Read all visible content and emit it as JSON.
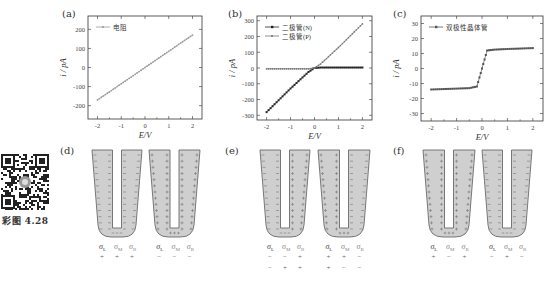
{
  "figure_caption": "彩图 4.28",
  "panels": {
    "a": {
      "label": "(a)"
    },
    "b": {
      "label": "(b)"
    },
    "c": {
      "label": "(c)"
    },
    "d": {
      "label": "(d)"
    },
    "e": {
      "label": "(e)"
    },
    "f": {
      "label": "(f)"
    }
  },
  "chart_data": [
    {
      "panel": "(a)",
      "type": "scatter",
      "xlabel": "E/V",
      "ylabel": "i / pA",
      "xlim": [
        -2.4,
        2.4
      ],
      "ylim": [
        -270,
        270
      ],
      "xticks": [
        -2,
        -1,
        0,
        1,
        2
      ],
      "yticks": [
        -200,
        -100,
        0,
        100,
        200
      ],
      "grid": false,
      "legend_position": "upper-left",
      "series": [
        {
          "name": "电阻",
          "color": "#9a9a9a",
          "marker": "dot",
          "x": [
            -2,
            -1.5,
            -1,
            -0.5,
            0,
            0.5,
            1,
            1.5,
            2
          ],
          "y": [
            -170,
            -128,
            -85,
            -43,
            0,
            43,
            85,
            128,
            170
          ]
        }
      ]
    },
    {
      "panel": "(b)",
      "type": "scatter",
      "xlabel": "E/V",
      "ylabel": "i / pA",
      "xlim": [
        -2.4,
        2.4
      ],
      "ylim": [
        -330,
        330
      ],
      "xticks": [
        -2,
        -1,
        0,
        1,
        2
      ],
      "yticks": [
        -300,
        -200,
        -100,
        0,
        100,
        200,
        300
      ],
      "grid": false,
      "legend_position": "upper-left",
      "series": [
        {
          "name": "二极管(N)",
          "color": "#222222",
          "marker": "square",
          "x": [
            -2,
            -1.5,
            -1,
            -0.5,
            -0.25,
            0,
            0.25,
            0.5,
            1,
            1.5,
            2
          ],
          "y": [
            -280,
            -205,
            -130,
            -60,
            -25,
            0,
            3,
            3,
            3,
            3,
            3
          ]
        },
        {
          "name": "二极管(P)",
          "color": "#777777",
          "marker": "dot",
          "x": [
            -2,
            -1.5,
            -1,
            -0.5,
            -0.25,
            0,
            0.25,
            0.5,
            1,
            1.5,
            2
          ],
          "y": [
            -5,
            -5,
            -5,
            -5,
            -5,
            0,
            25,
            60,
            130,
            205,
            280
          ]
        }
      ]
    },
    {
      "panel": "(c)",
      "type": "scatter",
      "xlabel": "E/V",
      "ylabel": "i / pA",
      "xlim": [
        -2.4,
        2.4
      ],
      "ylim": [
        -35,
        35
      ],
      "xticks": [
        -2,
        -1,
        0,
        1,
        2
      ],
      "yticks": [
        -30,
        -20,
        -10,
        0,
        10,
        20,
        30
      ],
      "grid": false,
      "legend_position": "upper-left",
      "series": [
        {
          "name": "双极性晶体管",
          "color": "#555555",
          "marker": "square",
          "x": [
            -2,
            -1.5,
            -1,
            -0.5,
            -0.2,
            -0.1,
            0,
            0.1,
            0.2,
            0.5,
            1,
            1.5,
            2
          ],
          "y": [
            -14,
            -13.7,
            -13.4,
            -13.1,
            -12,
            -6,
            0,
            6,
            12,
            12.6,
            13,
            13.3,
            13.6
          ]
        }
      ]
    }
  ],
  "legends": {
    "a": [
      "电阻"
    ],
    "b": [
      "二极管(N)",
      "二极管(P)"
    ],
    "c": [
      "双极性晶体管"
    ]
  },
  "axes": {
    "xlabel": "E/V",
    "ylabel": "i / pA",
    "a_yticks": [
      "200",
      "100",
      "0",
      "-100",
      "-200"
    ],
    "b_yticks": [
      "300",
      "200",
      "100",
      "0",
      "-100",
      "-200",
      "-300"
    ],
    "c_yticks": [
      "30",
      "20",
      "10",
      "0",
      "-10",
      "-20",
      "-30"
    ],
    "xticks": [
      "-2",
      "-1",
      "0",
      "1",
      "2"
    ]
  },
  "diagrams": {
    "sigma_labels": {
      "L": "σ",
      "L_sub": "L",
      "M": "σ",
      "M_sub": "M",
      "R": "σ",
      "R_sub": "R"
    },
    "d": [
      {
        "charges": {
          "left": "-",
          "mid_left": "-",
          "mid_right": "-",
          "right": "-"
        },
        "signs": [
          [
            "+",
            "+",
            "+"
          ]
        ]
      },
      {
        "charges": {
          "left": "+",
          "mid_left": "+",
          "mid_right": "+",
          "right": "+"
        },
        "signs": [
          [
            "−",
            "−",
            "−"
          ]
        ]
      }
    ],
    "e": [
      {
        "charges": {
          "left": "-",
          "mid_left": "-",
          "mid_right": "+",
          "right": "+"
        },
        "signs": [
          [
            "−",
            "−",
            "+"
          ],
          [
            "−",
            "+",
            "+"
          ]
        ]
      },
      {
        "charges": {
          "left": "+",
          "mid_left": "+",
          "mid_right": "-",
          "right": "-"
        },
        "signs": [
          [
            "+",
            "+",
            "−"
          ],
          [
            "+",
            "−",
            "−"
          ]
        ]
      }
    ],
    "f": [
      {
        "charges": {
          "left": "+",
          "mid_left": "+",
          "mid_right": "+",
          "right": "+"
        },
        "signs": [
          [
            "+",
            "−",
            "+"
          ]
        ]
      },
      {
        "charges": {
          "left": "-",
          "mid_left": "-",
          "mid_right": "-",
          "right": "-"
        },
        "signs": [
          [
            "−",
            "+",
            "−"
          ]
        ]
      }
    ]
  },
  "colors": {
    "u_fill": "#cfcfcf",
    "u_stroke": "#6a6a6a",
    "axis": "#333333"
  }
}
